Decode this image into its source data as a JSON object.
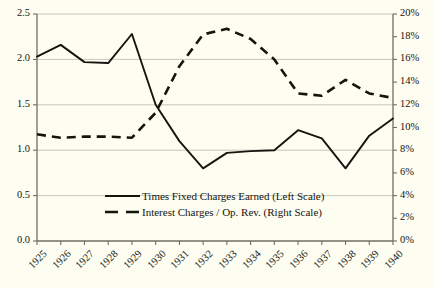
{
  "chart_data": {
    "type": "line",
    "title": "",
    "subtitle": "",
    "xlabel": "",
    "ylabel": "",
    "grid": true,
    "legend_position": "inside-bottom-center",
    "categories": [
      "1925",
      "1926",
      "1927",
      "1928",
      "1929",
      "1930",
      "1931",
      "1932",
      "1933",
      "1934",
      "1935",
      "1936",
      "1937",
      "1938",
      "1939",
      "1940"
    ],
    "axes": {
      "left": {
        "label": "",
        "ylim": [
          0.0,
          2.5
        ],
        "ticks": [
          0.0,
          0.5,
          1.0,
          1.5,
          2.0,
          2.5
        ],
        "tick_labels": [
          "0.0",
          "0.5",
          "1.0",
          "1.5",
          "2.0",
          "2.5"
        ]
      },
      "right": {
        "label": "",
        "ylim": [
          0,
          20
        ],
        "ticks": [
          0,
          2,
          4,
          6,
          8,
          10,
          12,
          14,
          16,
          18,
          20
        ],
        "tick_labels": [
          "0%",
          "2%",
          "4%",
          "6%",
          "8%",
          "10%",
          "12%",
          "14%",
          "16%",
          "18%",
          "20%"
        ]
      }
    },
    "series": [
      {
        "name": "Times Fixed Charges Earned (Left Scale)",
        "axis": "left",
        "style": "solid",
        "color": "#15150f",
        "values": [
          2.03,
          2.16,
          1.97,
          1.96,
          2.28,
          1.5,
          1.1,
          0.8,
          0.97,
          0.99,
          1.0,
          1.22,
          1.13,
          0.8,
          1.16,
          1.35
        ]
      },
      {
        "name": "Interest Charges / Op. Rev. (Right Scale)",
        "axis": "right",
        "style": "dashed",
        "color": "#15150f",
        "values": [
          9.4,
          9.1,
          9.2,
          9.2,
          9.1,
          11.3,
          15.4,
          18.2,
          18.7,
          17.8,
          16.0,
          13.0,
          12.8,
          14.2,
          13.0,
          12.6
        ]
      }
    ],
    "legend": [
      {
        "label": "Times Fixed Charges Earned (Left Scale)",
        "style": "solid"
      },
      {
        "label": "Interest Charges / Op. Rev. (Right Scale)",
        "style": "dashed"
      }
    ]
  },
  "colors": {
    "background": "#fdfdf2",
    "line": "#15150f",
    "grid": "#b9b9ad",
    "axis": "#6e6e62",
    "text": "#15150f"
  }
}
